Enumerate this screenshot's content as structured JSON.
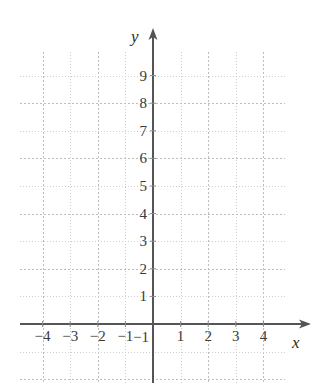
{
  "chart_data": {
    "type": "scatter",
    "title": "",
    "subtitle": "",
    "xlabel": "x",
    "ylabel": "y",
    "grid": true,
    "legend": null,
    "annotations": [],
    "series": [],
    "xlim": [
      -4.8,
      4.8
    ],
    "ylim": [
      -1.9,
      10.1
    ],
    "x_ticks": [
      -4,
      -3,
      -2,
      -1,
      1,
      2,
      3,
      4
    ],
    "y_ticks": [
      1,
      2,
      3,
      4,
      5,
      6,
      7,
      8,
      9
    ],
    "x_tick_labels": [
      "−4",
      "−3",
      "−2",
      "−1",
      "1",
      "2",
      "3",
      "4"
    ],
    "y_tick_labels": [
      "1",
      "2",
      "3",
      "4",
      "5",
      "6",
      "7",
      "8",
      "9"
    ],
    "y_negative_tick_label": "−1",
    "origin_label": "",
    "minor_grid_step": 1,
    "major_grid_step": 2,
    "axis_color": "#555555",
    "grid_color": "#cfcfcf",
    "grid_major_color": "#bdbdbd",
    "label_color": "#3a3a3a",
    "background_color": "#ffffff"
  },
  "axes": {
    "y_axis_label": "y",
    "x_axis_label": "x"
  }
}
